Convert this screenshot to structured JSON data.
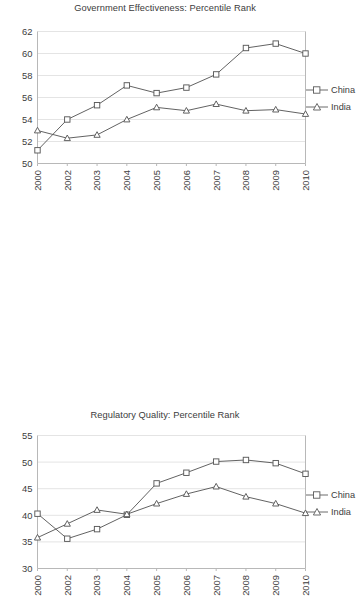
{
  "figure": {
    "background": "#ffffff",
    "line_color": "#5a5a5a",
    "grid_color": "#e4e4e4",
    "axis_color": "#b8b8b8",
    "text_color": "#3c3c3c"
  },
  "charts": [
    {
      "id": "government-effectiveness",
      "title": "Government Effectiveness: Percentile Rank",
      "legend": [
        {
          "label": "China",
          "marker": "square"
        },
        {
          "label": "India",
          "marker": "triangle"
        }
      ]
    },
    {
      "id": "regulatory-quality",
      "title": "Regulatory Quality: Percentile Rank",
      "legend": [
        {
          "label": "China",
          "marker": "square"
        },
        {
          "label": "India",
          "marker": "triangle"
        }
      ]
    }
  ],
  "chart_data": [
    {
      "type": "line",
      "title": "Government Effectiveness: Percentile Rank",
      "xlabel": "",
      "ylabel": "",
      "categories": [
        "2000",
        "2002",
        "2003",
        "2004",
        "2005",
        "2006",
        "2007",
        "2008",
        "2009",
        "2010"
      ],
      "yticks": [
        50,
        52,
        54,
        56,
        58,
        60,
        62
      ],
      "ylim": [
        50,
        62
      ],
      "grid": "horizontal",
      "legend_position": "right",
      "series": [
        {
          "name": "China",
          "marker": "square",
          "values": [
            51.2,
            54.0,
            55.3,
            57.1,
            56.4,
            56.9,
            58.1,
            60.5,
            60.9,
            60.0
          ]
        },
        {
          "name": "India",
          "marker": "triangle",
          "values": [
            53.0,
            52.3,
            52.6,
            54.0,
            55.1,
            54.8,
            55.4,
            54.8,
            54.9,
            54.5
          ]
        }
      ]
    },
    {
      "type": "line",
      "title": "Regulatory Quality: Percentile Rank",
      "xlabel": "",
      "ylabel": "",
      "categories": [
        "2000",
        "2002",
        "2003",
        "2004",
        "2005",
        "2006",
        "2007",
        "2008",
        "2009",
        "2010"
      ],
      "yticks": [
        30,
        35,
        40,
        45,
        50,
        55
      ],
      "ylim": [
        30,
        55
      ],
      "grid": "horizontal",
      "legend_position": "right",
      "series": [
        {
          "name": "China",
          "marker": "square",
          "values": [
            40.3,
            35.6,
            37.4,
            40.1,
            46.0,
            48.0,
            50.1,
            50.4,
            49.8,
            47.8
          ]
        },
        {
          "name": "India",
          "marker": "triangle",
          "values": [
            35.8,
            38.4,
            41.0,
            40.2,
            42.2,
            44.0,
            45.4,
            43.5,
            42.2,
            40.4
          ]
        }
      ]
    }
  ]
}
